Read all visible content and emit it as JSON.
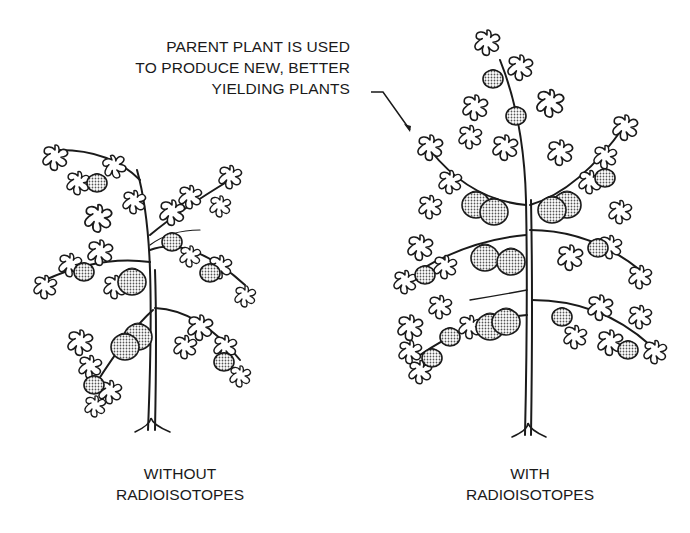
{
  "diagram": {
    "callout": {
      "lines": [
        "PARENT PLANT IS USED",
        "TO PRODUCE NEW, BETTER",
        "YIELDING PLANTS"
      ],
      "points_to": "plant-with-radioisotopes"
    },
    "plants": [
      {
        "id": "without",
        "caption_lines": [
          "WITHOUT",
          "RADIOISOTOPES"
        ],
        "fruit_count": 10,
        "size": "smaller"
      },
      {
        "id": "with",
        "caption_lines": [
          "WITH",
          "RADIOISOTOPES"
        ],
        "fruit_count": 20,
        "size": "larger"
      }
    ],
    "colors": {
      "line": "#1a1a1a",
      "fruit_fill": "#bdbdbd",
      "background": "#ffffff"
    }
  }
}
